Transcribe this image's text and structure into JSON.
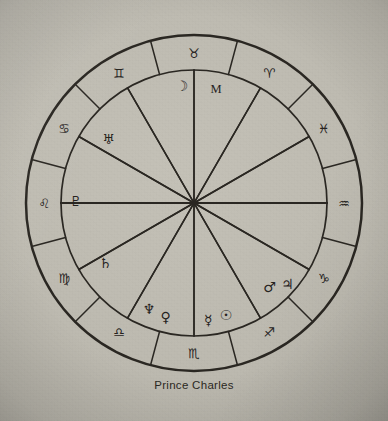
{
  "chart": {
    "title": "Prince Charles",
    "type": "astrological-natal-wheel",
    "caption": "Prince Charles",
    "geometry": {
      "center_x": 194,
      "center_y": 203,
      "outer_radius": 168,
      "sign_ring_inner_radius": 133,
      "sign_label_radius": 150,
      "planet_label_radius": 112
    },
    "ink_color": "#2a2722",
    "paper_color": "#bcb9af"
  },
  "zodiac_ring": {
    "label": "zodiac sign ring",
    "signs": [
      {
        "name": "Aries",
        "glyph": "♈",
        "angle_deg": 60,
        "label_angle_deg": 60
      },
      {
        "name": "Pisces",
        "glyph": "♓",
        "angle_deg": 30,
        "label_angle_deg": 30
      },
      {
        "name": "Aquarius",
        "glyph": "♒",
        "angle_deg": 0,
        "label_angle_deg": 0
      },
      {
        "name": "Capricorn",
        "glyph": "♑",
        "angle_deg": -30,
        "label_angle_deg": -30
      },
      {
        "name": "Sagittarius",
        "glyph": "♐",
        "angle_deg": -60,
        "label_angle_deg": -60
      },
      {
        "name": "Scorpio",
        "glyph": "♏",
        "angle_deg": -90,
        "label_angle_deg": -90
      },
      {
        "name": "Libra",
        "glyph": "♎",
        "angle_deg": -120,
        "label_angle_deg": -120
      },
      {
        "name": "Virgo",
        "glyph": "♍",
        "angle_deg": -150,
        "label_angle_deg": -150
      },
      {
        "name": "Leo",
        "glyph": "♌",
        "angle_deg": 180,
        "label_angle_deg": 180
      },
      {
        "name": "Cancer",
        "glyph": "♋",
        "angle_deg": 150,
        "label_angle_deg": 150
      },
      {
        "name": "Gemini",
        "glyph": "♊",
        "angle_deg": 120,
        "label_angle_deg": 120
      },
      {
        "name": "Taurus",
        "glyph": "♉",
        "angle_deg": 90,
        "label_angle_deg": 90
      }
    ],
    "division_count": 12,
    "division_offset_deg": 15
  },
  "houses": {
    "label": "house spokes",
    "count": 12,
    "spoke_angles_deg": [
      180,
      150,
      120,
      90,
      60,
      30,
      0,
      -30,
      -60,
      -90,
      -120,
      -150
    ],
    "axis_horizontal_label": "ascendant-descendant-axis",
    "axis_vertical_label": "midheaven-imum-coeli-axis"
  },
  "planets": {
    "label": "planet placements",
    "items": [
      {
        "name": "Moon",
        "glyph": "☽",
        "angle_deg": 96,
        "radius": 118
      },
      {
        "name": "Midheaven",
        "glyph": "M",
        "angle_deg": 79,
        "radius": 116,
        "marker": true
      },
      {
        "name": "Uranus",
        "glyph": "♅",
        "angle_deg": 143,
        "radius": 107
      },
      {
        "name": "Pluto",
        "glyph": "♇",
        "angle_deg": 179,
        "radius": 118
      },
      {
        "name": "Saturn",
        "glyph": "♄",
        "angle_deg": -146,
        "radius": 107
      },
      {
        "name": "Neptune",
        "glyph": "♆",
        "angle_deg": -113,
        "radius": 115
      },
      {
        "name": "Venus",
        "glyph": "♀",
        "angle_deg": -104,
        "radius": 117
      },
      {
        "name": "Mercury",
        "glyph": "☿",
        "angle_deg": -83,
        "radius": 118
      },
      {
        "name": "Sun",
        "glyph": "☉",
        "angle_deg": -74,
        "radius": 116
      },
      {
        "name": "Mars",
        "glyph": "♂",
        "angle_deg": -48,
        "radius": 113
      },
      {
        "name": "Jupiter",
        "glyph": "♃",
        "angle_deg": -41,
        "radius": 124
      }
    ]
  }
}
